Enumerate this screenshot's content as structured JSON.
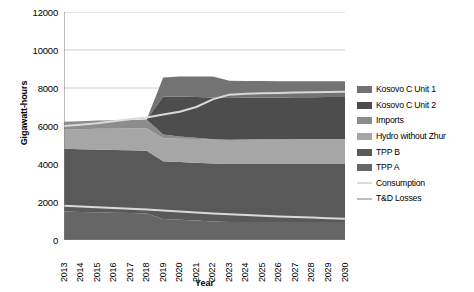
{
  "chart_data": {
    "type": "area",
    "title": "",
    "xlabel": "Year",
    "ylabel": "Gigawatt-hours",
    "xlim": [
      2013,
      2030
    ],
    "ylim": [
      0,
      12000
    ],
    "ytick_labels": [
      "12000",
      "10000",
      "8000",
      "6000",
      "4000",
      "2000",
      "0"
    ],
    "ytick_values": [
      12000,
      10000,
      8000,
      6000,
      4000,
      2000,
      0
    ],
    "grid": true,
    "legend_position": "right",
    "stacked": true,
    "categories": [
      "2013",
      "2014",
      "2015",
      "2016",
      "2017",
      "2018",
      "2019",
      "2020",
      "2021",
      "2022",
      "2023",
      "2024",
      "2025",
      "2026",
      "2027",
      "2028",
      "2029",
      "2030"
    ],
    "x": [
      2013,
      2014,
      2015,
      2016,
      2017,
      2018,
      2019,
      2020,
      2021,
      2022,
      2023,
      2024,
      2025,
      2026,
      2027,
      2028,
      2029,
      2030
    ],
    "series": [
      {
        "name": "TPP A",
        "kind": "area",
        "color": "#666666",
        "values": [
          1500,
          1480,
          1460,
          1440,
          1420,
          1400,
          1100,
          1060,
          1020,
          980,
          950,
          950,
          950,
          950,
          950,
          950,
          950,
          950
        ]
      },
      {
        "name": "TPP B",
        "kind": "area",
        "color": "#595959",
        "values": [
          3300,
          3300,
          3300,
          3300,
          3300,
          3300,
          3050,
          3050,
          3050,
          3050,
          3050,
          3050,
          3050,
          3050,
          3050,
          3050,
          3050,
          3050
        ]
      },
      {
        "name": "Hydro without Zhur",
        "kind": "area",
        "color": "#a6a6a6",
        "values": [
          1000,
          1050,
          1100,
          1120,
          1150,
          1180,
          1200,
          1220,
          1250,
          1270,
          1280,
          1290,
          1300,
          1300,
          1310,
          1310,
          1320,
          1320
        ]
      },
      {
        "name": "Imports",
        "kind": "area",
        "color": "#8c8c8c",
        "values": [
          420,
          420,
          430,
          440,
          450,
          460,
          200,
          120,
          60,
          0,
          0,
          0,
          0,
          0,
          0,
          0,
          0,
          0
        ]
      },
      {
        "name": "Kosovo C Unit 2",
        "kind": "area",
        "color": "#4d4d4d",
        "values": [
          0,
          0,
          0,
          0,
          0,
          0,
          2000,
          2100,
          2150,
          2200,
          2200,
          2200,
          2200,
          2200,
          2200,
          2200,
          2200,
          2200
        ]
      },
      {
        "name": "Kosovo C Unit 1",
        "kind": "area",
        "color": "#737373",
        "values": [
          0,
          0,
          0,
          0,
          0,
          0,
          1000,
          1050,
          1080,
          1100,
          900,
          880,
          870,
          860,
          850,
          850,
          840,
          840
        ]
      },
      {
        "name": "Consumption",
        "kind": "line",
        "color": "#d9d9d9",
        "values": [
          6000,
          6070,
          6150,
          6250,
          6350,
          6450,
          6600,
          6750,
          7000,
          7400,
          7650,
          7700,
          7720,
          7740,
          7760,
          7780,
          7790,
          7800
        ]
      },
      {
        "name": "T&D Losses",
        "kind": "line",
        "color": "#d9d9d9",
        "values": [
          1800,
          1760,
          1720,
          1680,
          1640,
          1600,
          1550,
          1500,
          1450,
          1400,
          1360,
          1320,
          1280,
          1240,
          1210,
          1180,
          1150,
          1120
        ]
      }
    ]
  },
  "legend": {
    "items": [
      {
        "label": "Kosovo C Unit 1",
        "color": "#737373",
        "kind": "area"
      },
      {
        "label": "Kosovo C Unit 2",
        "color": "#4d4d4d",
        "kind": "area"
      },
      {
        "label": "Imports",
        "color": "#8c8c8c",
        "kind": "area"
      },
      {
        "label": "Hydro without Zhur",
        "color": "#a6a6a6",
        "kind": "area"
      },
      {
        "label": "TPP B",
        "color": "#595959",
        "kind": "area"
      },
      {
        "label": "TPP A",
        "color": "#666666",
        "kind": "area"
      },
      {
        "label": "Consumption",
        "color": "#d9d9d9",
        "kind": "line"
      },
      {
        "label": "T&D Losses",
        "color": "#bfbfbf",
        "kind": "line"
      }
    ]
  },
  "axes": {
    "y_title": "Gigawatt-hours",
    "x_title": "Year"
  }
}
